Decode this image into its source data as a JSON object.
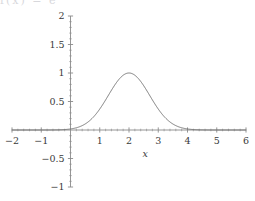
{
  "figure": {
    "background_color": "#ffffff",
    "axis_color": "#8a8a8a",
    "curve_color": "#6e6e6e",
    "label_color": "#3a3a3a",
    "cropped_top_text": "f(x) = e"
  },
  "chart_data": {
    "type": "line",
    "title": "",
    "subtitle": "",
    "xlabel": "x",
    "ylabel": "",
    "xlim": [
      -2,
      6
    ],
    "ylim": [
      -1,
      2
    ],
    "grid": false,
    "legend": null,
    "axis_style": "centered-spines",
    "xticks": [
      -2,
      -1,
      1,
      2,
      3,
      4,
      5,
      6
    ],
    "xtick_labels": [
      "-2",
      "-1",
      "1",
      "2",
      "3",
      "4",
      "5",
      "6"
    ],
    "yticks": [
      -1,
      -0.5,
      0.5,
      1,
      1.5,
      2
    ],
    "ytick_labels": [
      "-1",
      "-0.5",
      "0.5",
      "1",
      "1.5",
      "2"
    ],
    "minor_ticks": true,
    "series": [
      {
        "name": "gaussian",
        "function": "exp(-(x-2)^2)",
        "peak_x": 2,
        "peak_y": 1,
        "sigma": 0.7071,
        "x": [
          -2,
          -1.75,
          -1.5,
          -1.25,
          -1,
          -0.75,
          -0.5,
          -0.25,
          0,
          0.25,
          0.5,
          0.75,
          1,
          1.25,
          1.5,
          1.75,
          2,
          2.25,
          2.5,
          2.75,
          3,
          3.25,
          3.5,
          3.75,
          4,
          4.25,
          4.5,
          4.75,
          5,
          5.25,
          5.5,
          5.75,
          6
        ],
        "y": [
          0.0,
          0.0,
          0.0,
          0.0,
          0.0001,
          0.0005,
          0.0019,
          0.0063,
          0.0183,
          0.0468,
          0.1054,
          0.2096,
          0.3679,
          0.5698,
          0.7788,
          0.9394,
          1.0,
          0.9394,
          0.7788,
          0.5698,
          0.3679,
          0.2096,
          0.1054,
          0.0468,
          0.0183,
          0.0063,
          0.0019,
          0.0005,
          0.0001,
          0.0,
          0.0,
          0.0,
          0.0
        ]
      }
    ]
  }
}
